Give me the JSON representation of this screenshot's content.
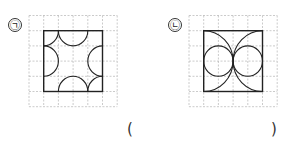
{
  "figures": [
    {
      "id": "a",
      "label": "㉠",
      "grid_cells": 6,
      "square_cells": 4,
      "shape": "semicircles-and-quarter-circles"
    },
    {
      "id": "b",
      "label": "㉡",
      "grid_cells": 6,
      "square_cells": 4,
      "shape": "circles-and-arcs"
    }
  ],
  "answer": {
    "open": "(",
    "close": ")",
    "value": ""
  }
}
